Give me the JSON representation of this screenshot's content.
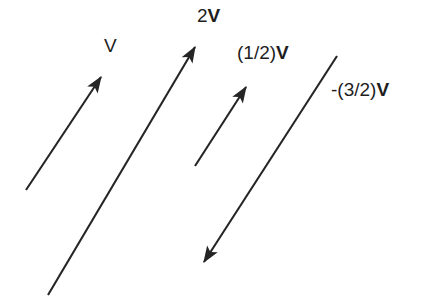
{
  "figure": {
    "background_color": "#ffffff",
    "stroke_color": "#252525",
    "width": 425,
    "height": 308
  },
  "vectors": [
    {
      "id": "v",
      "name": "V",
      "label_plain": "V",
      "label_bold": "",
      "scalar": 1,
      "x1": 26,
      "y1": 190,
      "x2": 104,
      "y2": 73,
      "arrowhead_at": "tip",
      "double_headed": false,
      "direction": "up-right"
    },
    {
      "id": "2v",
      "name": "2V",
      "label_plain": "2",
      "label_bold": "V",
      "scalar": 2,
      "x1": 48,
      "y1": 295,
      "x2": 199,
      "y2": 41,
      "arrowhead_at": "tip",
      "double_headed": false,
      "direction": "up-right"
    },
    {
      "id": "half-v",
      "name": "(1/2)V",
      "label_plain": "(1/2)",
      "label_bold": "V",
      "scalar": 0.5,
      "x1": 195,
      "y1": 166,
      "x2": 249,
      "y2": 82,
      "arrowhead_at": "tip",
      "double_headed": false,
      "direction": "up-right"
    },
    {
      "id": "neg-3-2v",
      "name": "-(3/2)V",
      "label_plain": "-(3/2)",
      "label_bold": "V",
      "scalar": -1.5,
      "x1": 337,
      "y1": 56,
      "x2": 199,
      "y2": 270,
      "arrowhead_at": "tip",
      "double_headed": false,
      "direction": "down-left"
    }
  ],
  "labels": {
    "v": {
      "plain": "V",
      "bold": ""
    },
    "two_v": {
      "plain": "2",
      "bold": "V"
    },
    "half_v": {
      "plain": "(1/2)",
      "bold": "V"
    },
    "neg_three_halves_v": {
      "plain": "-(3/2)",
      "bold": "V"
    }
  }
}
